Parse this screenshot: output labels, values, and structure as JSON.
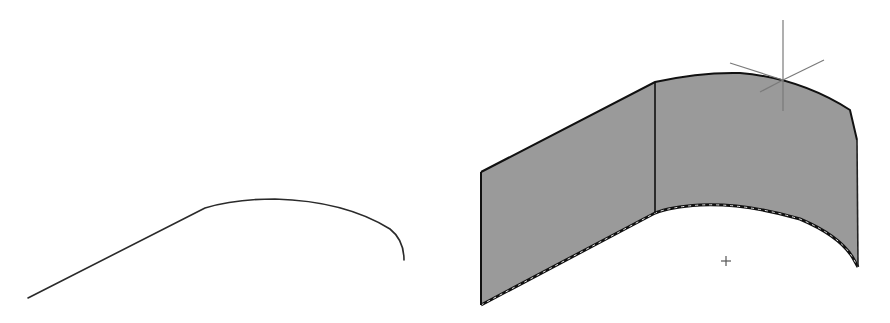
{
  "figure": {
    "colors": {
      "background": "#ffffff",
      "profile_stroke": "#2a2a2a",
      "surface_fill": "#9a9a9a",
      "surface_edge": "#111111",
      "axis_stroke": "#7a7a7a"
    }
  },
  "profile_2d": {
    "label": "2D profile: straight line tangent to arc",
    "path": "M28,298 L205,208 Q235,199 275,199 Q345,201 390,229 Q404,240 404,260"
  },
  "surface_3d": {
    "label": "Extruded surface",
    "outline_path": "M481,172 L655,82 Q700,72 740,73 Q800,78 850,110 L857,140 L857,250 L858,267 L853,260 Q840,236 800,219 Q745,203 700,205 Q670,207 655,213 L481,305 Z",
    "top_edge_path": "M481,172 L655,82 Q700,72 740,73 Q800,78 850,110 L857,140",
    "bottom_edge_path": "M481,305 L655,213 Q670,207 700,205 Q745,203 800,219 Q840,236 853,258 L858,267",
    "left_edge": {
      "x1": 481,
      "y1": 172,
      "x2": 481,
      "y2": 305
    },
    "divider_edge": {
      "x1": 655,
      "y1": 82,
      "x2": 655,
      "y2": 213
    },
    "right_edge": {
      "x1": 857,
      "y1": 140,
      "x2": 858,
      "y2": 267
    }
  },
  "ucs_icon": {
    "label": "Coordinate axes marker",
    "center": [
      783,
      80
    ],
    "vertical": {
      "x1": 783,
      "y1": 20,
      "x2": 783,
      "y2": 111
    },
    "diag_a": {
      "x1": 730,
      "y1": 63,
      "x2": 783,
      "y2": 80
    },
    "diag_b": {
      "x1": 783,
      "y1": 80,
      "x2": 824,
      "y2": 60
    },
    "diag_c": {
      "x1": 760,
      "y1": 92,
      "x2": 783,
      "y2": 80
    }
  },
  "point_marker": {
    "label": "+",
    "x": 726,
    "y": 261
  }
}
